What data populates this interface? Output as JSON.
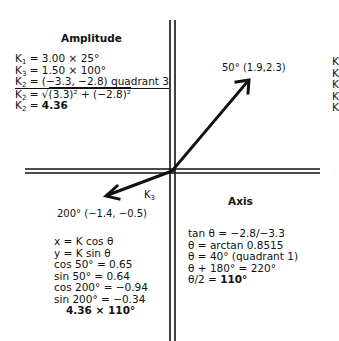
{
  "amplitude": {
    "title": "Amplitude",
    "lines": [
      {
        "lhs": "K",
        "sub": "1",
        "rhs": " = 3.00 × 25°"
      },
      {
        "lhs": "K",
        "sub": "3",
        "rhs": " = 1.50 × 100°"
      },
      {
        "lhs": "K",
        "sub": "2",
        "rhs": " = (−3.3, −2.8) quadrant 3"
      },
      {
        "lhs": "K",
        "sub": "2",
        "rhs_pre": " = √",
        "rhs": "(3.3)² + (−2.8)²"
      },
      {
        "lhs": "K",
        "sub": "2",
        "rhs_pre": " = ",
        "rhs": "4.36"
      }
    ]
  },
  "vectors": {
    "v1_label": "50° (1.9,2.3)",
    "v2_label": "200° (−1.4, −0.5)",
    "v2_name": "K",
    "v2_name_sub": "3"
  },
  "axis": {
    "title": "Axis",
    "lines": [
      "tan θ = −2.8/−3.3",
      "θ = arctan 0.8515",
      "θ = 40° (quadrant 1)",
      "θ + 180° = 220°",
      "θ/2 = "
    ],
    "final_value": "110°"
  },
  "components": {
    "lines": [
      "x = K cos θ",
      "y = K sin θ",
      "cos 50° = 0.65",
      "sin 50° = 0.64",
      "cos 200° = −0.94",
      "sin 200° = −0.34"
    ],
    "result": "4.36 × 110°"
  },
  "clipped_right": [
    "K",
    "K",
    "K",
    "K",
    "K"
  ]
}
